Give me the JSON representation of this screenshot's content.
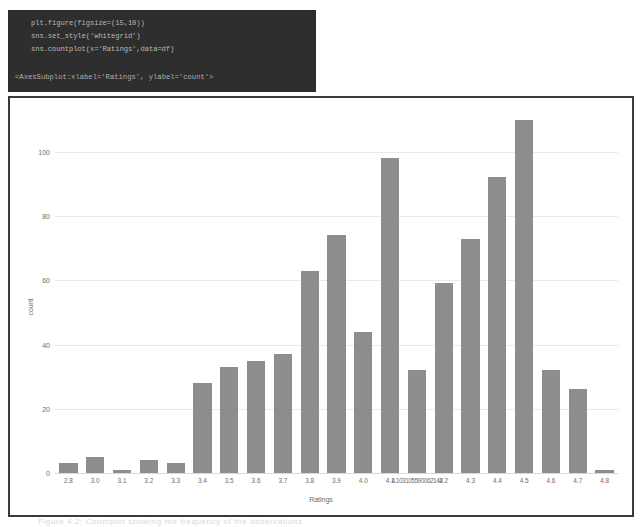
{
  "notebook": {
    "code_lines": [
      "plt.figure(figsize=(15,10))",
      "sns.set_style('whitegrid')",
      "sns.countplot(x='Ratings',data=df)"
    ],
    "output_text": "<AxesSubplot:xlabel='Ratings', ylabel='count'>"
  },
  "caption": "Figure 4.2: Countplot showing the frequency of the observations",
  "chart_data": {
    "type": "bar",
    "title": "",
    "xlabel": "Ratings",
    "ylabel": "count",
    "ylim": [
      0,
      113
    ],
    "yticks": [
      0,
      20,
      40,
      60,
      80,
      100
    ],
    "grid": true,
    "bar_color": "#8d8d8d",
    "categories": [
      "2.8",
      "3.0",
      "3.1",
      "3.2",
      "3.3",
      "3.4",
      "3.5",
      "3.6",
      "3.7",
      "3.8",
      "3.9",
      "4.0",
      "4.1",
      "4.103105590062142",
      "4.2",
      "4.3",
      "4.4",
      "4.5",
      "4.6",
      "4.7",
      "4.8"
    ],
    "values": [
      3,
      5,
      1,
      4,
      3,
      28,
      33,
      35,
      37,
      63,
      74,
      44,
      98,
      32,
      59,
      73,
      92,
      110,
      32,
      26,
      1
    ]
  }
}
